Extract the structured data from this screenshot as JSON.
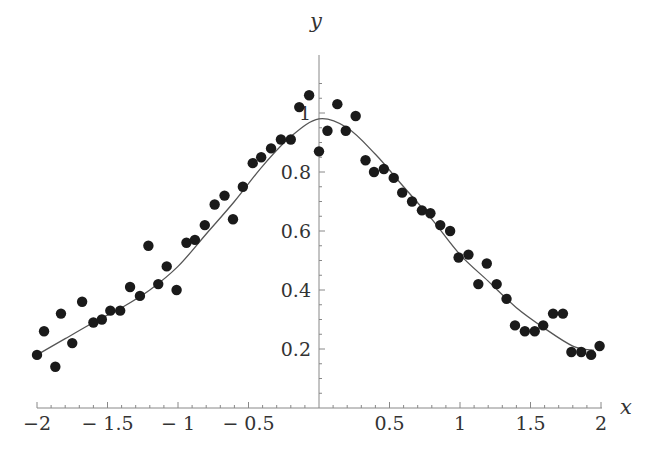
{
  "chart_data": {
    "type": "scatter",
    "title": "",
    "xlabel": "x",
    "ylabel": "y",
    "xlim": [
      -2,
      2
    ],
    "ylim": [
      0,
      1.1
    ],
    "grid": false,
    "legend": null,
    "x_ticks": [
      -2,
      -1.5,
      -1,
      -0.5,
      0.5,
      1,
      1.5,
      2
    ],
    "x_tick_labels": [
      "−2",
      "− 1.5",
      "− 1",
      "− 0.5",
      "0.5",
      "1",
      "1.5",
      "2"
    ],
    "y_ticks": [
      0.2,
      0.4,
      0.6,
      0.8,
      1
    ],
    "y_tick_labels": [
      "0.2",
      "0.4",
      "0.6",
      "0.8",
      "1"
    ],
    "series": [
      {
        "name": "data",
        "kind": "scatter",
        "marker": "filled-circle",
        "color": "#1a1a1a",
        "points": [
          [
            -2.0,
            0.18
          ],
          [
            -1.95,
            0.26
          ],
          [
            -1.87,
            0.14
          ],
          [
            -1.83,
            0.32
          ],
          [
            -1.75,
            0.22
          ],
          [
            -1.68,
            0.36
          ],
          [
            -1.6,
            0.29
          ],
          [
            -1.54,
            0.3
          ],
          [
            -1.48,
            0.33
          ],
          [
            -1.41,
            0.33
          ],
          [
            -1.34,
            0.41
          ],
          [
            -1.27,
            0.38
          ],
          [
            -1.21,
            0.55
          ],
          [
            -1.14,
            0.42
          ],
          [
            -1.08,
            0.48
          ],
          [
            -1.01,
            0.4
          ],
          [
            -0.94,
            0.56
          ],
          [
            -0.88,
            0.57
          ],
          [
            -0.81,
            0.62
          ],
          [
            -0.74,
            0.69
          ],
          [
            -0.67,
            0.72
          ],
          [
            -0.61,
            0.64
          ],
          [
            -0.54,
            0.75
          ],
          [
            -0.47,
            0.83
          ],
          [
            -0.41,
            0.85
          ],
          [
            -0.34,
            0.88
          ],
          [
            -0.27,
            0.91
          ],
          [
            -0.2,
            0.91
          ],
          [
            -0.14,
            1.02
          ],
          [
            -0.07,
            1.06
          ],
          [
            0.0,
            0.87
          ],
          [
            0.06,
            0.94
          ],
          [
            0.13,
            1.03
          ],
          [
            0.19,
            0.94
          ],
          [
            0.26,
            0.99
          ],
          [
            0.33,
            0.84
          ],
          [
            0.39,
            0.8
          ],
          [
            0.46,
            0.81
          ],
          [
            0.53,
            0.78
          ],
          [
            0.59,
            0.73
          ],
          [
            0.66,
            0.7
          ],
          [
            0.73,
            0.67
          ],
          [
            0.79,
            0.66
          ],
          [
            0.86,
            0.62
          ],
          [
            0.93,
            0.6
          ],
          [
            0.99,
            0.51
          ],
          [
            1.06,
            0.52
          ],
          [
            1.13,
            0.42
          ],
          [
            1.19,
            0.49
          ],
          [
            1.26,
            0.42
          ],
          [
            1.33,
            0.37
          ],
          [
            1.39,
            0.28
          ],
          [
            1.46,
            0.26
          ],
          [
            1.53,
            0.26
          ],
          [
            1.59,
            0.28
          ],
          [
            1.66,
            0.32
          ],
          [
            1.73,
            0.32
          ],
          [
            1.79,
            0.19
          ],
          [
            1.86,
            0.19
          ],
          [
            1.93,
            0.18
          ],
          [
            1.99,
            0.21
          ]
        ]
      },
      {
        "name": "fit",
        "kind": "line",
        "color": "#555555",
        "points": [
          [
            -2.0,
            0.18
          ],
          [
            -1.8,
            0.235
          ],
          [
            -1.6,
            0.29
          ],
          [
            -1.4,
            0.34
          ],
          [
            -1.2,
            0.4
          ],
          [
            -1.0,
            0.48
          ],
          [
            -0.8,
            0.59
          ],
          [
            -0.6,
            0.7
          ],
          [
            -0.4,
            0.82
          ],
          [
            -0.2,
            0.92
          ],
          [
            0.0,
            0.98
          ],
          [
            0.2,
            0.95
          ],
          [
            0.4,
            0.86
          ],
          [
            0.6,
            0.75
          ],
          [
            0.8,
            0.64
          ],
          [
            1.0,
            0.52
          ],
          [
            1.2,
            0.43
          ],
          [
            1.4,
            0.34
          ],
          [
            1.6,
            0.27
          ],
          [
            1.8,
            0.21
          ],
          [
            1.95,
            0.195
          ]
        ]
      }
    ]
  }
}
